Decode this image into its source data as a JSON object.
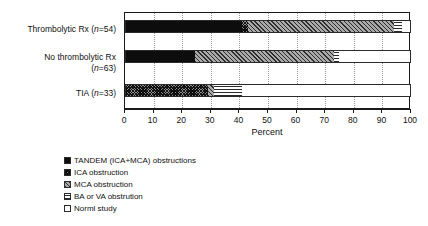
{
  "chart_data": {
    "type": "bar",
    "orientation": "horizontal",
    "stacked": true,
    "stack_mode": "percent",
    "title": "",
    "xlabel": "Percent",
    "ylabel": "",
    "xlim": [
      0,
      100
    ],
    "ylim": null,
    "grid": "vertical-dotted",
    "legend_position": "bottom-left",
    "xticks": [
      0,
      10,
      20,
      30,
      40,
      50,
      60,
      70,
      80,
      90,
      100
    ],
    "xtick_labels": [
      "0",
      "10",
      "20",
      "30",
      "40",
      "50",
      "60",
      "70",
      "80",
      "90",
      "100"
    ],
    "categories": [
      "Thrombolytic Rx (n=54)",
      "No thrombolytic Rx (n=63)",
      "TIA (n=33)"
    ],
    "series": [
      {
        "name": "TANDEM (ICA+MCA) obstructions",
        "values": [
          41.0,
          24.5,
          0.0
        ]
      },
      {
        "name": "ICA obstruction",
        "values": [
          2.0,
          0.0,
          29.0
        ]
      },
      {
        "name": "MCA obstruction",
        "values": [
          51.0,
          48.5,
          2.0
        ]
      },
      {
        "name": "BA or VA obstrution",
        "values": [
          3.0,
          2.0,
          10.0
        ]
      },
      {
        "name": "Norml study",
        "values": [
          3.0,
          25.0,
          59.0
        ]
      }
    ]
  },
  "axis": {
    "x_title": "Percent"
  },
  "categories_display": [
    {
      "line1": "Thrombolytic Rx (",
      "italic": "n",
      "line1b": "=54)",
      "line2": ""
    },
    {
      "line1": "No thrombolytic Rx",
      "italic": "n",
      "line1b": "=63)",
      "line2": "("
    },
    {
      "line1": "TIA (",
      "italic": "n",
      "line1b": "=33)",
      "line2": ""
    }
  ],
  "legend": {
    "items": [
      {
        "label": "TANDEM (ICA+MCA) obstructions",
        "pattern": "solid-black",
        "swatch_name": "swatch-tandem"
      },
      {
        "label": "ICA obstruction",
        "pattern": "dense-cross-hatch",
        "swatch_name": "swatch-ica"
      },
      {
        "label": "MCA obstruction",
        "pattern": "diagonal-hatch",
        "swatch_name": "swatch-mca"
      },
      {
        "label": "BA or VA obstrution",
        "pattern": "horizontal-lines",
        "swatch_name": "swatch-bava"
      },
      {
        "label": "Norml study",
        "pattern": "white",
        "swatch_name": "swatch-normal"
      }
    ]
  },
  "colors": {
    "axis": "#1a1a1a",
    "grid": "#9a9a9a",
    "tandem": "#0d0d0d",
    "ica": "#8d8d8d",
    "mca": "#a9a9a9",
    "bava": "#ffffff",
    "normal": "#ffffff",
    "background": "#ffffff"
  }
}
